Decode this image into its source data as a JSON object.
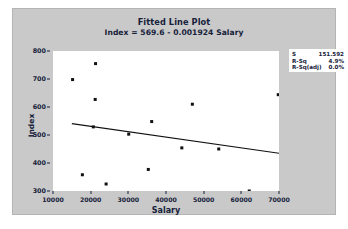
{
  "chart_data": {
    "type": "scatter",
    "title": "Fitted Line Plot",
    "subtitle": "Index = 569.6 - 0.001924 Salary",
    "xlabel": "Salary",
    "ylabel": "Index",
    "xlim": [
      10000,
      70000
    ],
    "ylim": [
      300,
      800
    ],
    "xticks": [
      "10000",
      "20000",
      "30000",
      "40000",
      "50000",
      "60000",
      "70000"
    ],
    "xtick_values": [
      10000,
      20000,
      30000,
      40000,
      50000,
      60000,
      70000
    ],
    "yticks": [
      "800",
      "700",
      "600",
      "500",
      "400",
      "300"
    ],
    "ytick_values": [
      800,
      700,
      600,
      500,
      400,
      300
    ],
    "grid": false,
    "legend_position": "top-right",
    "points": [
      {
        "x": 15200,
        "y": 698
      },
      {
        "x": 21300,
        "y": 755
      },
      {
        "x": 21200,
        "y": 627
      },
      {
        "x": 20700,
        "y": 529
      },
      {
        "x": 17800,
        "y": 358
      },
      {
        "x": 24100,
        "y": 325
      },
      {
        "x": 30100,
        "y": 503
      },
      {
        "x": 35300,
        "y": 377
      },
      {
        "x": 36200,
        "y": 548
      },
      {
        "x": 44200,
        "y": 454
      },
      {
        "x": 47000,
        "y": 610
      },
      {
        "x": 47000,
        "y": 292
      },
      {
        "x": 54000,
        "y": 450
      },
      {
        "x": 62100,
        "y": 300
      },
      {
        "x": 69800,
        "y": 644
      }
    ],
    "fit_line": {
      "intercept": 569.6,
      "slope": -0.001924,
      "x_start": 15000,
      "x_end": 70000,
      "y_start": 540.74,
      "y_end": 434.92
    },
    "stats": [
      {
        "label": "S",
        "value": "151.592"
      },
      {
        "label": "R-Sq",
        "value": "4.9%"
      },
      {
        "label": "R-Sq(adj)",
        "value": "0.0%"
      }
    ]
  },
  "colors": {
    "figure_background": "#c9c9c9",
    "plot_background": "#ffffff",
    "text": "#16213a",
    "marker": "#111111",
    "fit_line": "#111111"
  }
}
